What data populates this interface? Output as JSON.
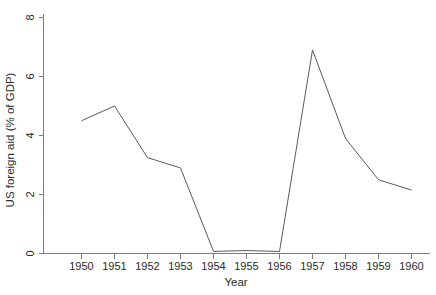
{
  "chart_data": {
    "type": "line",
    "title": "",
    "subtitle": "",
    "xlabel": "Year",
    "ylabel": "US foreign aid (% of GDP)",
    "x": [
      1950,
      1951,
      1952,
      1953,
      1954,
      1955,
      1956,
      1957,
      1958,
      1959,
      1960
    ],
    "categories": [
      "1950",
      "1951",
      "1952",
      "1953",
      "1954",
      "1955",
      "1956",
      "1957",
      "1958",
      "1959",
      "1960"
    ],
    "values": [
      4.5,
      5.0,
      3.25,
      2.9,
      0.07,
      0.1,
      0.07,
      6.9,
      3.9,
      2.5,
      2.15
    ],
    "series": [
      {
        "name": "US foreign aid (% of GDP)",
        "values": [
          4.5,
          5.0,
          3.25,
          2.9,
          0.07,
          0.1,
          0.07,
          6.9,
          3.9,
          2.5,
          2.15
        ],
        "color": "#5a5a5a"
      }
    ],
    "xlim": [
      1949.4,
      1960.6
    ],
    "ylim": [
      0,
      8
    ],
    "yticks": [
      0,
      2,
      4,
      6,
      8
    ],
    "ytick_labels": [
      "0",
      "2",
      "4",
      "6",
      "8"
    ],
    "xticks": [
      1950,
      1951,
      1952,
      1953,
      1954,
      1955,
      1956,
      1957,
      1958,
      1959,
      1960
    ],
    "xtick_labels": [
      "1950",
      "1951",
      "1952",
      "1953",
      "1954",
      "1955",
      "1956",
      "1957",
      "1958",
      "1959",
      "1960"
    ],
    "grid": false,
    "legend": false,
    "legend_position": "none",
    "annotations": []
  },
  "figure": {
    "background_color": "#ffffff",
    "axis_color": "#7d7d7d",
    "line_color": "#5a5a5a",
    "text_color": "#2b2b2b"
  }
}
